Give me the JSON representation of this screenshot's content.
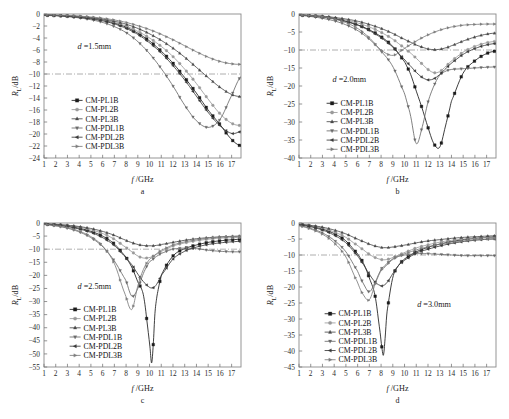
{
  "figure": {
    "background": "#ffffff",
    "axis_color": "#8a8a8a",
    "ref_line_value": -10
  },
  "series_names": [
    "CM-PL1B",
    "CM-PL2B",
    "CM-PL3B",
    "CM-PDL1B",
    "CM-PDL2B",
    "CM-PDL3B"
  ],
  "series_markers": [
    "square",
    "circle",
    "triangle-up",
    "triangle-down",
    "triangle-left",
    "triangle-right"
  ],
  "series_colors": [
    "#1c1c1c",
    "#9a9a9a",
    "#4a4a4a",
    "#6a6a6a",
    "#3a3a3a",
    "#7d7d7d"
  ],
  "axis_labels": {
    "x_italic": "f",
    "x_rest": " /GHz",
    "y_main": "R",
    "y_sub": "L",
    "y_rest": "/dB"
  },
  "panels": [
    {
      "letter": "a",
      "annotation_italic": "d",
      "annotation_rest": " =1.5mm",
      "annotation_x": 0.17,
      "annotation_y": 0.24,
      "legend_x": 0.14,
      "legend_y": 0.6,
      "chart_data": {
        "type": "line",
        "title": "",
        "xlabel": "f /GHz",
        "ylabel": "R_L/dB",
        "xlim": [
          1,
          17.8
        ],
        "ylim": [
          -24,
          0
        ],
        "xticks": [
          1,
          2,
          3,
          4,
          5,
          6,
          7,
          8,
          9,
          10,
          11,
          12,
          13,
          14,
          15,
          16,
          17
        ],
        "yticks": [
          0,
          -2,
          -4,
          -6,
          -8,
          -10,
          -12,
          -14,
          -16,
          -18,
          -20,
          -22,
          -24
        ],
        "grid": false,
        "legend_position": "lower-left",
        "annotations": [
          "d =1.5mm"
        ],
        "x": [
          1,
          2,
          3,
          4,
          5,
          6,
          7,
          8,
          9,
          10,
          11,
          12,
          13,
          14,
          15,
          16,
          17,
          17.8
        ],
        "series": [
          {
            "name": "CM-PL1B",
            "values": [
              -0.2,
              -0.25,
              -0.35,
              -0.5,
              -0.7,
              -1.0,
              -1.5,
              -2.2,
              -3.2,
              -4.5,
              -6.2,
              -8.2,
              -10.6,
              -13.2,
              -16.0,
              -18.4,
              -20.9,
              -22.0
            ]
          },
          {
            "name": "CM-PL2B",
            "values": [
              -0.2,
              -0.25,
              -0.35,
              -0.5,
              -0.7,
              -1.0,
              -1.4,
              -2.0,
              -2.9,
              -4.0,
              -5.4,
              -7.1,
              -9.2,
              -11.6,
              -14.2,
              -16.6,
              -18.2,
              -18.6
            ]
          },
          {
            "name": "CM-PL3B",
            "values": [
              -0.15,
              -0.2,
              -0.3,
              -0.4,
              -0.6,
              -0.85,
              -1.2,
              -1.7,
              -2.4,
              -3.3,
              -4.4,
              -5.7,
              -7.2,
              -8.9,
              -10.6,
              -12.2,
              -13.4,
              -13.8
            ]
          },
          {
            "name": "CM-PDL1B",
            "values": [
              -0.25,
              -0.3,
              -0.45,
              -0.65,
              -0.95,
              -1.4,
              -2.1,
              -3.1,
              -4.6,
              -6.6,
              -9.1,
              -12.0,
              -15.2,
              -17.8,
              -18.9,
              -17.6,
              -13.6,
              -10.4
            ]
          },
          {
            "name": "CM-PDL2B",
            "values": [
              -0.2,
              -0.25,
              -0.38,
              -0.55,
              -0.8,
              -1.15,
              -1.65,
              -2.4,
              -3.4,
              -4.8,
              -6.5,
              -8.6,
              -11.0,
              -13.7,
              -16.4,
              -18.6,
              -19.9,
              -19.6
            ]
          },
          {
            "name": "CM-PDL3B",
            "values": [
              -0.12,
              -0.18,
              -0.25,
              -0.35,
              -0.5,
              -0.7,
              -1.0,
              -1.4,
              -1.95,
              -2.6,
              -3.4,
              -4.3,
              -5.3,
              -6.3,
              -7.2,
              -7.9,
              -8.3,
              -8.4
            ]
          }
        ]
      }
    },
    {
      "letter": "b",
      "annotation_italic": "d",
      "annotation_rest": " =2.0mm",
      "annotation_x": 0.17,
      "annotation_y": 0.47,
      "legend_x": 0.14,
      "legend_y": 0.62,
      "chart_data": {
        "type": "line",
        "title": "",
        "xlabel": "f /GHz",
        "ylabel": "R_L/dB",
        "xlim": [
          1,
          17.8
        ],
        "ylim": [
          -40,
          0
        ],
        "xticks": [
          1,
          2,
          3,
          4,
          5,
          6,
          7,
          8,
          9,
          10,
          11,
          12,
          13,
          14,
          15,
          16,
          17
        ],
        "yticks": [
          0,
          -5,
          -10,
          -15,
          -20,
          -25,
          -30,
          -35,
          -40
        ],
        "grid": false,
        "legend_position": "lower-left",
        "annotations": [
          "d =2.0mm"
        ],
        "x": [
          1,
          2,
          3,
          4,
          5,
          6,
          7,
          8,
          9,
          10,
          10.5,
          11,
          11.5,
          12,
          12.5,
          13,
          13.5,
          14,
          15,
          16,
          17,
          17.8
        ],
        "series": [
          {
            "name": "CM-PL1B",
            "values": [
              -0.3,
              -0.5,
              -0.8,
              -1.3,
              -2.0,
              -3.0,
              -4.4,
              -6.3,
              -9.0,
              -13.2,
              -16.6,
              -21.4,
              -26.2,
              -31.5,
              -36.0,
              -37.0,
              -31.0,
              -24.2,
              -16.4,
              -13.0,
              -11.0,
              -10.3
            ]
          },
          {
            "name": "CM-PL2B",
            "values": [
              -0.3,
              -0.45,
              -0.7,
              -1.1,
              -1.7,
              -2.5,
              -3.6,
              -5.1,
              -7.0,
              -9.4,
              -10.8,
              -12.3,
              -13.9,
              -15.4,
              -16.3,
              -16.0,
              -14.6,
              -13.0,
              -10.6,
              -9.0,
              -8.0,
              -7.6
            ]
          },
          {
            "name": "CM-PL3B",
            "values": [
              -0.25,
              -0.4,
              -0.6,
              -0.95,
              -1.4,
              -2.0,
              -2.9,
              -4.0,
              -5.4,
              -7.0,
              -7.8,
              -8.6,
              -9.2,
              -9.7,
              -9.9,
              -9.8,
              -9.4,
              -8.8,
              -7.5,
              -6.4,
              -5.6,
              -5.3
            ]
          },
          {
            "name": "CM-PDL1B",
            "values": [
              -0.4,
              -0.7,
              -1.2,
              -1.9,
              -3.0,
              -4.6,
              -7.0,
              -10.3,
              -14.6,
              -22.0,
              -28.0,
              -36.0,
              -31.5,
              -24.5,
              -20.0,
              -17.0,
              -15.9,
              -15.4,
              -15.2,
              -15.0,
              -14.8,
              -14.7
            ]
          },
          {
            "name": "CM-PDL2B",
            "values": [
              -0.3,
              -0.5,
              -0.85,
              -1.35,
              -2.1,
              -3.1,
              -4.6,
              -6.6,
              -9.2,
              -12.6,
              -14.4,
              -16.2,
              -17.6,
              -18.3,
              -18.0,
              -16.8,
              -15.2,
              -13.6,
              -11.2,
              -9.6,
              -8.6,
              -8.2
            ]
          },
          {
            "name": "CM-PDL3B",
            "values": [
              -0.25,
              -0.45,
              -0.8,
              -1.4,
              -2.4,
              -4.0,
              -6.6,
              -10.0,
              -11.5,
              -9.6,
              -8.5,
              -7.5,
              -6.6,
              -5.8,
              -5.1,
              -4.5,
              -4.0,
              -3.6,
              -3.1,
              -2.9,
              -2.8,
              -2.8
            ]
          }
        ]
      }
    },
    {
      "letter": "c",
      "annotation_italic": "d",
      "annotation_rest": " =2.5mm",
      "annotation_x": 0.17,
      "annotation_y": 0.46,
      "legend_x": 0.13,
      "legend_y": 0.6,
      "chart_data": {
        "type": "line",
        "title": "",
        "xlabel": "f /GHz",
        "ylabel": "R_L/dB",
        "xlim": [
          1,
          17.8
        ],
        "ylim": [
          -55,
          0
        ],
        "xticks": [
          1,
          2,
          3,
          4,
          5,
          6,
          7,
          8,
          9,
          10,
          11,
          12,
          13,
          14,
          15,
          16,
          17
        ],
        "yticks": [
          0,
          -5,
          -10,
          -15,
          -20,
          -25,
          -30,
          -35,
          -40,
          -45,
          -50,
          -55
        ],
        "grid": false,
        "legend_position": "lower-left",
        "annotations": [
          "d =2.5mm"
        ],
        "x": [
          1,
          2,
          3,
          4,
          5,
          6,
          7,
          8,
          8.5,
          9,
          9.5,
          10,
          10.2,
          10.5,
          11,
          12,
          13,
          14,
          15,
          16,
          17,
          17.8
        ],
        "series": [
          {
            "name": "CM-PL1B",
            "values": [
              -0.4,
              -0.7,
              -1.2,
              -2.0,
              -3.2,
              -5.0,
              -8.0,
              -13.0,
              -17.0,
              -22.5,
              -28.0,
              -45.0,
              -53.0,
              -32.0,
              -20.0,
              -12.6,
              -9.8,
              -8.4,
              -7.4,
              -6.8,
              -6.4,
              -6.2
            ]
          },
          {
            "name": "CM-PL2B",
            "values": [
              -0.35,
              -0.6,
              -1.0,
              -1.6,
              -2.6,
              -4.0,
              -6.2,
              -9.3,
              -11.0,
              -12.6,
              -13.4,
              -13.2,
              -12.9,
              -12.2,
              -10.8,
              -8.8,
              -7.6,
              -6.8,
              -6.2,
              -5.8,
              -5.6,
              -5.5
            ]
          },
          {
            "name": "CM-PL3B",
            "values": [
              -0.3,
              -0.5,
              -0.85,
              -1.35,
              -2.1,
              -3.2,
              -4.7,
              -6.6,
              -7.5,
              -8.2,
              -8.6,
              -8.7,
              -8.7,
              -8.6,
              -8.2,
              -7.4,
              -6.6,
              -6.0,
              -5.6,
              -5.3,
              -5.1,
              -5.0
            ]
          },
          {
            "name": "CM-PDL1B",
            "values": [
              -0.6,
              -1.1,
              -2.0,
              -3.4,
              -5.6,
              -9.0,
              -14.5,
              -22.0,
              -28.0,
              -25.0,
              -19.0,
              -15.0,
              -14.2,
              -13.0,
              -11.6,
              -10.0,
              -9.6,
              -9.8,
              -10.4,
              -10.8,
              -11.0,
              -11.0
            ]
          },
          {
            "name": "CM-PDL2B",
            "values": [
              -0.45,
              -0.8,
              -1.4,
              -2.3,
              -3.6,
              -5.6,
              -8.6,
              -13.2,
              -16.0,
              -19.5,
              -22.5,
              -24.5,
              -24.8,
              -24.0,
              -20.0,
              -13.8,
              -10.8,
              -9.2,
              -8.2,
              -7.6,
              -7.2,
              -7.0
            ]
          },
          {
            "name": "CM-PDL3B",
            "values": [
              -0.5,
              -1.0,
              -1.8,
              -3.1,
              -5.2,
              -8.8,
              -15.5,
              -28.0,
              -33.0,
              -24.0,
              -17.5,
              -14.0,
              -13.2,
              -12.0,
              -10.4,
              -8.4,
              -7.2,
              -6.4,
              -5.8,
              -5.4,
              -5.2,
              -5.1
            ]
          }
        ]
      }
    },
    {
      "letter": "d",
      "annotation_italic": "d",
      "annotation_rest": " =3.0mm",
      "annotation_x": 0.6,
      "annotation_y": 0.58,
      "legend_x": 0.13,
      "legend_y": 0.63,
      "chart_data": {
        "type": "line",
        "title": "",
        "xlabel": "f /GHz",
        "ylabel": "R_L/dB",
        "xlim": [
          1,
          17.8
        ],
        "ylim": [
          -45,
          0
        ],
        "xticks": [
          1,
          2,
          3,
          4,
          5,
          6,
          7,
          8,
          9,
          10,
          11,
          12,
          13,
          14,
          15,
          16,
          17
        ],
        "yticks": [
          0,
          -5,
          -10,
          -15,
          -20,
          -25,
          -30,
          -35,
          -40,
          -45
        ],
        "grid": false,
        "legend_position": "lower-left",
        "annotations": [
          "d =3.0mm"
        ],
        "x": [
          1,
          2,
          3,
          4,
          5,
          6,
          6.5,
          7,
          7.5,
          8,
          8.2,
          8.5,
          9,
          9.5,
          10,
          11,
          12,
          13,
          14,
          15,
          16,
          17,
          17.8
        ],
        "series": [
          {
            "name": "CM-PL1B",
            "values": [
              -0.5,
              -1.0,
              -1.9,
              -3.3,
              -5.6,
              -9.6,
              -12.6,
              -17.2,
              -23.0,
              -36.0,
              -41.3,
              -28.0,
              -17.0,
              -13.2,
              -11.2,
              -9.0,
              -7.6,
              -6.6,
              -5.8,
              -5.2,
              -4.8,
              -4.5,
              -4.4
            ]
          },
          {
            "name": "CM-PL2B",
            "values": [
              -0.45,
              -0.9,
              -1.6,
              -2.8,
              -4.5,
              -7.0,
              -8.4,
              -9.8,
              -10.8,
              -11.4,
              -11.5,
              -11.4,
              -10.8,
              -10.0,
              -9.2,
              -7.8,
              -6.8,
              -6.0,
              -5.4,
              -5.0,
              -4.7,
              -4.5,
              -4.4
            ]
          },
          {
            "name": "CM-PL3B",
            "values": [
              -0.4,
              -0.75,
              -1.3,
              -2.2,
              -3.4,
              -5.0,
              -5.8,
              -6.6,
              -7.2,
              -7.6,
              -7.7,
              -7.7,
              -7.5,
              -7.2,
              -6.9,
              -6.2,
              -5.6,
              -5.2,
              -4.8,
              -4.5,
              -4.3,
              -4.1,
              -4.0
            ]
          },
          {
            "name": "CM-PDL1B",
            "values": [
              -0.8,
              -1.7,
              -3.1,
              -5.4,
              -9.0,
              -15.0,
              -19.0,
              -21.5,
              -18.5,
              -14.6,
              -13.8,
              -12.6,
              -11.2,
              -10.4,
              -10.0,
              -9.6,
              -9.6,
              -9.8,
              -10.0,
              -10.2,
              -10.2,
              -10.2,
              -10.2
            ]
          },
          {
            "name": "CM-PDL2B",
            "values": [
              -0.6,
              -1.2,
              -2.2,
              -3.8,
              -6.2,
              -10.2,
              -13.0,
              -16.0,
              -18.5,
              -19.6,
              -19.5,
              -18.6,
              -15.8,
              -13.2,
              -11.6,
              -9.4,
              -8.2,
              -7.2,
              -6.4,
              -5.8,
              -5.4,
              -5.1,
              -5.0
            ]
          },
          {
            "name": "CM-PDL3B",
            "values": [
              -0.9,
              -1.9,
              -3.5,
              -6.2,
              -10.6,
              -18.5,
              -22.5,
              -24.0,
              -19.0,
              -15.0,
              -14.2,
              -13.0,
              -11.4,
              -10.4,
              -9.6,
              -8.4,
              -7.4,
              -6.6,
              -6.0,
              -5.6,
              -5.2,
              -5.0,
              -4.9
            ]
          }
        ]
      }
    }
  ]
}
